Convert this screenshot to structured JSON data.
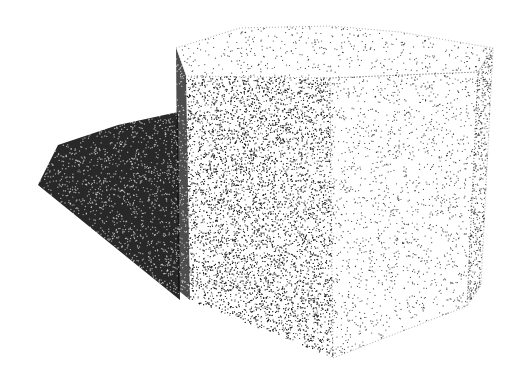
{
  "scene": {
    "description": "Stippled rendering of a hexagonal prism casting a shadow",
    "background": "#ffffff",
    "ink": "#111111",
    "shadow": {
      "polygon": [
        [
          38,
          185
        ],
        [
          58,
          145
        ],
        [
          118,
          125
        ],
        [
          178,
          112
        ],
        [
          180,
          300
        ]
      ],
      "density": 0.9
    },
    "prism": {
      "top_face": [
        [
          176,
          48
        ],
        [
          240,
          28
        ],
        [
          330,
          26
        ],
        [
          400,
          32
        ],
        [
          493,
          48
        ],
        [
          478,
          72
        ],
        [
          330,
          78
        ],
        [
          186,
          76
        ]
      ],
      "left_dark_face": [
        [
          176,
          48
        ],
        [
          186,
          76
        ],
        [
          190,
          300
        ],
        [
          178,
          290
        ]
      ],
      "front_left_face": [
        [
          186,
          76
        ],
        [
          330,
          78
        ],
        [
          333,
          358
        ],
        [
          190,
          300
        ]
      ],
      "front_right_face": [
        [
          330,
          78
        ],
        [
          478,
          72
        ],
        [
          467,
          306
        ],
        [
          333,
          358
        ]
      ],
      "right_edge_face": [
        [
          478,
          72
        ],
        [
          493,
          48
        ],
        [
          481,
          285
        ],
        [
          467,
          306
        ]
      ],
      "densities": {
        "top_face": 0.05,
        "left_dark_face": 0.75,
        "front_left_face": 0.35,
        "front_right_face": 0.07,
        "right_edge_face": 0.25
      }
    }
  }
}
